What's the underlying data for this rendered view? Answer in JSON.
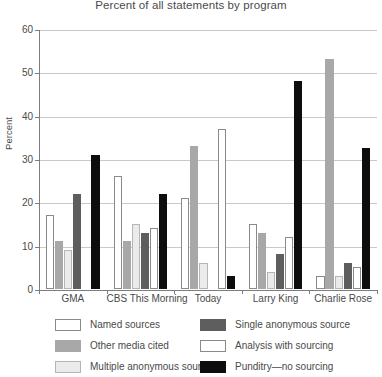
{
  "chart_data": {
    "type": "bar",
    "title": "Percent of all statements by program",
    "xlabel": "",
    "ylabel": "Percent",
    "ylim": [
      0,
      60
    ],
    "ytick_step": 10,
    "yticks": [
      60,
      50,
      40,
      30,
      20,
      10,
      0
    ],
    "grid": true,
    "legend_position": "bottom",
    "categories": [
      "GMA",
      "CBS This Morning",
      "Today",
      "Larry King",
      "Charlie Rose"
    ],
    "series": [
      {
        "name": "Named sources",
        "color": "#ffffff",
        "values": [
          17,
          26,
          21,
          15,
          3
        ]
      },
      {
        "name": "Other media cited",
        "color": "#a8a8a8",
        "values": [
          11,
          11,
          33,
          13,
          53
        ]
      },
      {
        "name": "Multiple anonymous sources",
        "color": "#ebebeb",
        "values": [
          9,
          15,
          6,
          4,
          3
        ]
      },
      {
        "name": "Single anonymous source",
        "color": "#5e5e5e",
        "values": [
          22,
          13,
          0,
          8,
          6
        ]
      },
      {
        "name": "Analysis with sourcing",
        "color": "#ffffff",
        "values": [
          0,
          14,
          37,
          12,
          5
        ]
      },
      {
        "name": "Punditry—no sourcing",
        "color": "#0d0d0d",
        "values": [
          31,
          22,
          3,
          48,
          32.5
        ]
      }
    ]
  },
  "legend": {
    "left_column": [
      {
        "label": "Named sources",
        "swatch": "white-swatch"
      },
      {
        "label": "Other media cited",
        "swatch": "medium-gray-swatch"
      },
      {
        "label": "Multiple anonymous sources",
        "swatch": "light-gray-swatch"
      }
    ],
    "right_column": [
      {
        "label": "Single anonymous source",
        "swatch": "dark-gray-swatch"
      },
      {
        "label": "Analysis with sourcing",
        "swatch": "white-swatch"
      },
      {
        "label": "Punditry—no sourcing",
        "swatch": "black-swatch"
      }
    ]
  }
}
